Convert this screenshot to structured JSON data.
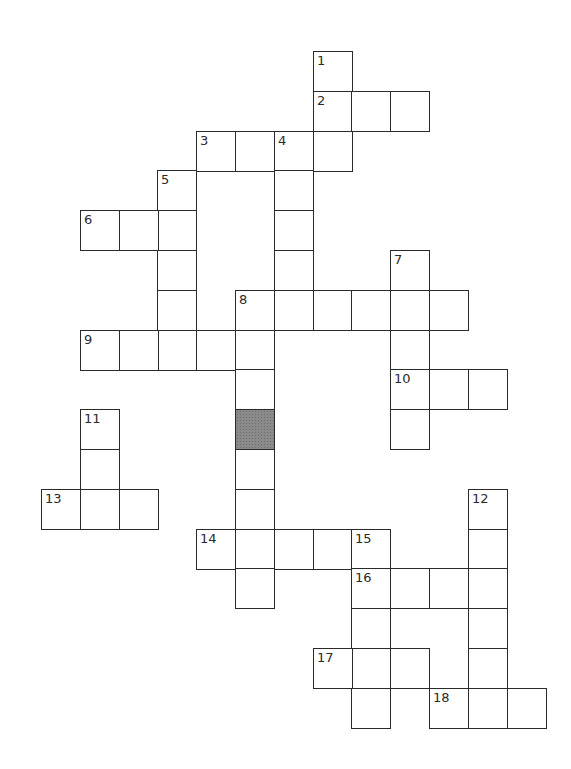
{
  "puzzle": {
    "origin_x": 41,
    "origin_y": 51,
    "cell_w": 38.8,
    "cell_h": 39.8,
    "shaded_cells": [
      [
        5,
        9
      ]
    ],
    "words": [
      {
        "number": "1",
        "direction": "down",
        "col": 7,
        "row": 0,
        "length": 3
      },
      {
        "number": "2",
        "direction": "across",
        "col": 7,
        "row": 1,
        "length": 3
      },
      {
        "number": "3",
        "direction": "across",
        "col": 4,
        "row": 2,
        "length": 4
      },
      {
        "number": "4",
        "direction": "down",
        "col": 6,
        "row": 2,
        "length": 5
      },
      {
        "number": "5",
        "direction": "down",
        "col": 3,
        "row": 3,
        "length": 5
      },
      {
        "number": "6",
        "direction": "across",
        "col": 1,
        "row": 4,
        "length": 3
      },
      {
        "number": "7",
        "direction": "down",
        "col": 9,
        "row": 5,
        "length": 5
      },
      {
        "number": "8",
        "direction": "across",
        "col": 5,
        "row": 6,
        "length": 6
      },
      {
        "number": "8",
        "direction": "down",
        "col": 5,
        "row": 6,
        "length": 8
      },
      {
        "number": "9",
        "direction": "across",
        "col": 1,
        "row": 7,
        "length": 5
      },
      {
        "number": "10",
        "direction": "across",
        "col": 9,
        "row": 8,
        "length": 3
      },
      {
        "number": "11",
        "direction": "down",
        "col": 1,
        "row": 9,
        "length": 3
      },
      {
        "number": "12",
        "direction": "down",
        "col": 11,
        "row": 11,
        "length": 6
      },
      {
        "number": "13",
        "direction": "across",
        "col": 0,
        "row": 11,
        "length": 3
      },
      {
        "number": "14",
        "direction": "across",
        "col": 4,
        "row": 12,
        "length": 5
      },
      {
        "number": "15",
        "direction": "down",
        "col": 8,
        "row": 12,
        "length": 5
      },
      {
        "number": "16",
        "direction": "across",
        "col": 8,
        "row": 13,
        "length": 4
      },
      {
        "number": "17",
        "direction": "across",
        "col": 7,
        "row": 15,
        "length": 3
      },
      {
        "number": "18",
        "direction": "across",
        "col": 10,
        "row": 16,
        "length": 3
      }
    ]
  }
}
